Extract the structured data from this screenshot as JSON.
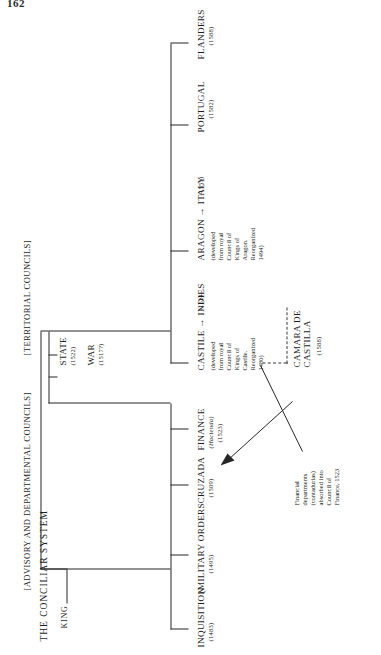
{
  "folio": "162",
  "diagram": {
    "title": "THE CONCILIAR SYSTEM",
    "root": "KING",
    "groups": {
      "advisory": "[ADVISORY AND DEPARTMENTAL COUNCILS]",
      "territorial": "[TERRITORIAL COUNCILS]"
    },
    "departmental": [
      {
        "name": "STATE",
        "date": "(1522)"
      },
      {
        "name": "WAR",
        "date": "(1517?)"
      }
    ],
    "advisory_councils": [
      {
        "name": "INQUISITION",
        "date": "(1483)"
      },
      {
        "name": "(MILITARY ORDERS",
        "date": "(1495)"
      },
      {
        "name": "CRUZADA",
        "date": "(1509)"
      },
      {
        "name": "FINANCE",
        "alt": "(Hacienda)",
        "date": "(1523)"
      }
    ],
    "territorial_councils": [
      {
        "name": "CASTILE → INDIES",
        "date": "(1524",
        "note": "(developed\nfrom royal\nCouncil of\nKings of\nCastile.\nReorganized\n1480)"
      },
      {
        "name": "ARAGON → ITALY",
        "date": "(1555)",
        "note": "(developed\nfrom royal\nCouncil of\nKings of\nAragon.\nReorganized\n1494)"
      },
      {
        "name": "PORTUGAL",
        "date": "(1582)",
        "note": ""
      },
      {
        "name": "FLANDERS",
        "date": "(1588)",
        "note": ""
      }
    ],
    "camara": {
      "name": "CAMARA DE\nCASTILLA",
      "date": "(1588)"
    },
    "finance_note": "Financial\ndepartments\n(contadurias)\nabsorbed into\nCouncil of\nFinance, 1523"
  }
}
